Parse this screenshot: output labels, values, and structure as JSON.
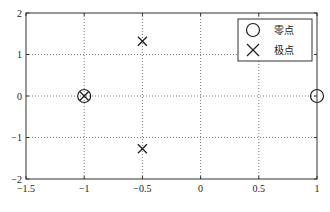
{
  "chart_data": {
    "type": "scatter",
    "title": "",
    "xlabel": "",
    "ylabel": "",
    "xlim": [
      -1.5,
      1
    ],
    "ylim": [
      -2,
      2
    ],
    "grid": true,
    "legend_position": "upper right",
    "x_ticks": [
      -1.5,
      -1,
      -0.5,
      0,
      0.5,
      1
    ],
    "x_tick_labels": [
      "-1.5",
      "-1",
      "-0.5",
      "0",
      "0.5",
      "1"
    ],
    "y_ticks": [
      -2,
      -1,
      0,
      1,
      2
    ],
    "y_tick_labels": [
      "-2",
      "-1",
      "0",
      "1",
      "2"
    ],
    "series": [
      {
        "name": "零点",
        "marker": "circle",
        "points": [
          {
            "x": -1,
            "y": 0
          },
          {
            "x": 1,
            "y": 0
          }
        ]
      },
      {
        "name": "极点",
        "marker": "x",
        "points": [
          {
            "x": -1,
            "y": 0
          },
          {
            "x": -0.5,
            "y": 1.32
          },
          {
            "x": -0.5,
            "y": -1.27
          }
        ]
      }
    ]
  },
  "legend": {
    "items": [
      {
        "label": "零点",
        "marker": "circle"
      },
      {
        "label": "极点",
        "marker": "x"
      }
    ]
  },
  "colors": {
    "axis": "#333333",
    "grid": "#555555",
    "marker": "#222222",
    "background": "#ffffff"
  }
}
